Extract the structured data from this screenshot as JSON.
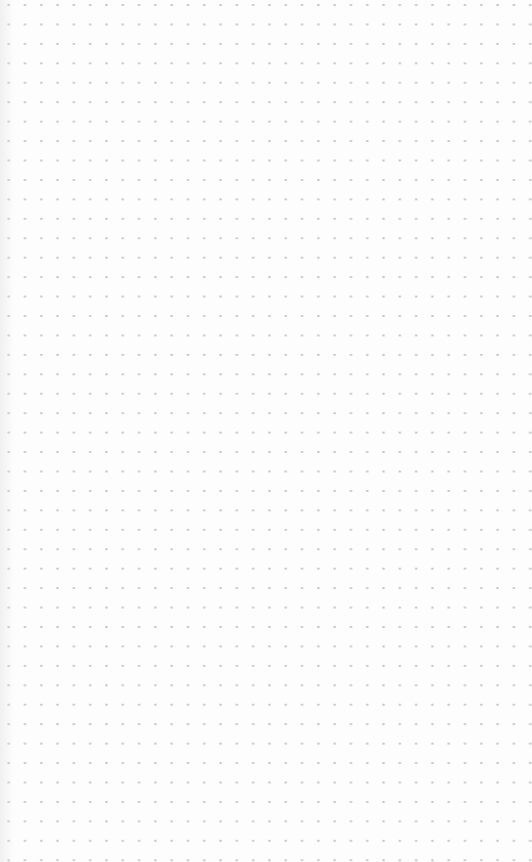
{
  "canvas": {
    "type": "dot-grid",
    "background_color": "#fdfdfd",
    "dot_color": "#c4c4c4",
    "dot_spacing_x": 16.3,
    "dot_spacing_y": 19.45,
    "first_dot_x": 25,
    "first_dot_y": 5,
    "content": ""
  }
}
